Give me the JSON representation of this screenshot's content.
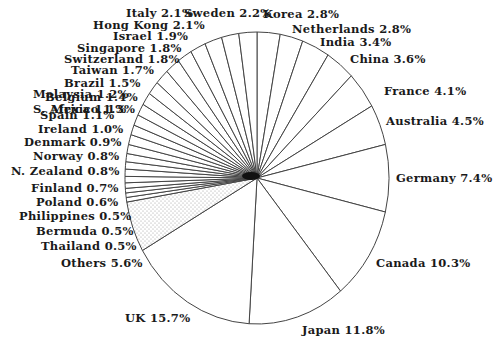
{
  "chart_data": {
    "type": "pie",
    "title": "",
    "start_angle_deg": 0,
    "direction": "clockwise",
    "center": [
      257,
      178
    ],
    "radius": [
      132,
      146
    ],
    "slices": [
      {
        "label": "Korea",
        "value": 2.8,
        "text": "Korea 2.8%",
        "pos": [
          263,
          9
        ]
      },
      {
        "label": "Netherlands",
        "value": 2.8,
        "text": "Netherlands 2.8%",
        "pos": [
          292,
          24
        ]
      },
      {
        "label": "India",
        "value": 3.4,
        "text": "India 3.4%",
        "pos": [
          320,
          37
        ]
      },
      {
        "label": "China",
        "value": 3.6,
        "text": "China 3.6%",
        "pos": [
          350,
          54
        ]
      },
      {
        "label": "France",
        "value": 4.1,
        "text": "France 4.1%",
        "pos": [
          384,
          86
        ]
      },
      {
        "label": "Australia",
        "value": 4.5,
        "text": "Australia 4.5%",
        "pos": [
          386,
          116
        ]
      },
      {
        "label": "Germany",
        "value": 7.4,
        "text": "Germany 7.4%",
        "pos": [
          396,
          173
        ]
      },
      {
        "label": "Canada",
        "value": 10.3,
        "text": "Canada 10.3%",
        "pos": [
          376,
          258
        ]
      },
      {
        "label": "Japan",
        "value": 11.8,
        "text": "Japan 11.8%",
        "pos": [
          302,
          325
        ]
      },
      {
        "label": "UK",
        "value": 15.7,
        "text": "UK 15.7%",
        "pos": [
          125,
          313
        ]
      },
      {
        "label": "Others",
        "value": 5.6,
        "text": "Others 5.6%",
        "pos": [
          61,
          258
        ],
        "pattern": "stipple"
      },
      {
        "label": "Thailand",
        "value": 0.5,
        "text": "Thailand 0.5%",
        "pos": [
          41,
          241
        ]
      },
      {
        "label": "Bermuda",
        "value": 0.5,
        "text": "Bermuda 0.5%",
        "pos": [
          36,
          226
        ]
      },
      {
        "label": "Philippines",
        "value": 0.5,
        "text": "Philippines 0.5%",
        "pos": [
          19,
          211
        ]
      },
      {
        "label": "Poland",
        "value": 0.6,
        "text": "Poland 0.6%",
        "pos": [
          36,
          197
        ]
      },
      {
        "label": "Finland",
        "value": 0.7,
        "text": "Finland 0.7%",
        "pos": [
          31,
          183
        ]
      },
      {
        "label": "N. Zealand",
        "value": 0.8,
        "text": "N. Zealand 0.8%",
        "pos": [
          11,
          166
        ]
      },
      {
        "label": "Norway",
        "value": 0.8,
        "text": "Norway 0.8%",
        "pos": [
          33,
          151
        ]
      },
      {
        "label": "Denmark",
        "value": 0.9,
        "text": "Denmark 0.9%",
        "pos": [
          24,
          137
        ]
      },
      {
        "label": "Ireland",
        "value": 1.0,
        "text": "Ireland 1.0%",
        "pos": [
          38,
          124
        ]
      },
      {
        "label": "Spain",
        "value": 1.1,
        "text": "Spain 1.1%",
        "pos": [
          40,
          110
        ]
      },
      {
        "label": "S. Africa",
        "value": 1.1,
        "text": "S. Africa 1.1%",
        "pos": [
          33,
          104
        ]
      },
      {
        "label": "Malaysia",
        "value": 1.2,
        "text": "Malaysia 1.2%",
        "pos": [
          33,
          89
        ]
      },
      {
        "label": "Mexico",
        "value": 1.3,
        "text": "Mexico 1.3%",
        "pos": [
          51,
          104
        ]
      },
      {
        "label": "Belgium",
        "value": 1.4,
        "text": "Belgium 1.4%",
        "pos": [
          45,
          92
        ]
      },
      {
        "label": "Brazil",
        "value": 1.5,
        "text": "Brazil 1.5%",
        "pos": [
          64,
          78
        ]
      },
      {
        "label": "Taiwan",
        "value": 1.7,
        "text": "Taiwan 1.7%",
        "pos": [
          71,
          65
        ]
      },
      {
        "label": "Switzerland",
        "value": 1.8,
        "text": "Switzerland 1.8%",
        "pos": [
          64,
          54
        ]
      },
      {
        "label": "Singapore",
        "value": 1.8,
        "text": "Singapore 1.8%",
        "pos": [
          77,
          43
        ]
      },
      {
        "label": "Israel",
        "value": 1.9,
        "text": "Israel 1.9%",
        "pos": [
          113,
          31
        ]
      },
      {
        "label": "Hong Kong",
        "value": 2.1,
        "text": "Hong Kong 2.1%",
        "pos": [
          93,
          20
        ]
      },
      {
        "label": "Italy",
        "value": 2.1,
        "text": "Italy 2.1%",
        "pos": [
          126,
          8
        ]
      },
      {
        "label": "Sweden",
        "value": 2.2,
        "text": "Sweden 2.2%",
        "pos": [
          184,
          8
        ]
      }
    ],
    "style": {
      "fill": "#ffffff",
      "stroke": "#444444",
      "stipple_color": "#9a9a9a"
    },
    "legend": "none",
    "grid": false
  }
}
